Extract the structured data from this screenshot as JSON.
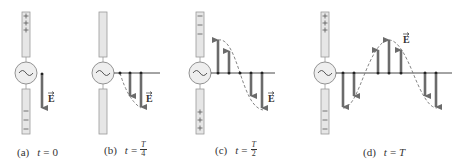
{
  "figure": {
    "panels": [
      {
        "id": "a",
        "label": "(a)",
        "time_var": "t",
        "equals": "=",
        "time_value": "0",
        "fraction": null,
        "top_charge": "+",
        "bottom_charge": "−",
        "field_label": "E"
      },
      {
        "id": "b",
        "label": "(b)",
        "time_var": "t",
        "equals": "=",
        "time_value": null,
        "fraction": {
          "num": "T",
          "den": "4"
        },
        "top_charge": "",
        "bottom_charge": "",
        "field_label": "E"
      },
      {
        "id": "c",
        "label": "(c)",
        "time_var": "t",
        "equals": "=",
        "time_value": null,
        "fraction": {
          "num": "T",
          "den": "2"
        },
        "top_charge": "−",
        "bottom_charge": "+",
        "field_label": "E"
      },
      {
        "id": "d",
        "label": "(d)",
        "time_var": "t",
        "equals": "=",
        "time_value": "T",
        "fraction": null,
        "top_charge": "+",
        "bottom_charge": "−",
        "field_label": "E"
      }
    ],
    "colors": {
      "arrow": "#6b6b6b",
      "antenna_fill": "#e6e6e6",
      "antenna_stroke": "#999999",
      "axis": "#333333",
      "wave": "#777777"
    }
  }
}
